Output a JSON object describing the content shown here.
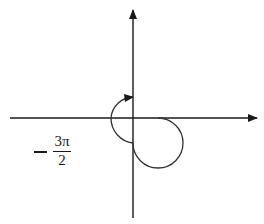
{
  "diagram": {
    "type": "angle-on-coordinate-axes",
    "angle_label": {
      "sign": "−",
      "numerator": "3π",
      "denominator": "2"
    },
    "rotation_direction": "clockwise",
    "start_ray": "positive x-axis",
    "terminal_ray": "positive y-axis",
    "colors": {
      "axes": "#1a1a1a",
      "arc": "#333333",
      "background": "#ffffff"
    }
  }
}
